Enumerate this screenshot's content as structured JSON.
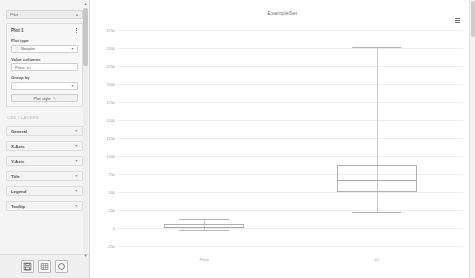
{
  "panel": {
    "header_title": "Plot",
    "header_icon": "collapse-icon",
    "plot_card": {
      "title": "Plot 1",
      "menu_icon": "kebab-menu-icon",
      "plot_type_label": "Plot type",
      "plot_type_value": "Boxplot",
      "plot_type_glyph": "boxplot-glyph",
      "value_columns_label": "Value columns",
      "value_columns_value": "Price, x#",
      "group_by_label": "Group by",
      "group_by_value": "-",
      "plot_style_label": "Plot style",
      "plot_style_glyph": "brush-icon"
    },
    "section_caption": "CSS / LAYERS",
    "accordions": [
      {
        "label": "General"
      },
      {
        "label": "X-Axis"
      },
      {
        "label": "Y-Axis"
      },
      {
        "label": "Title"
      },
      {
        "label": "Legend"
      },
      {
        "label": "Tooltip"
      }
    ],
    "toolbar": [
      {
        "name": "save-button",
        "icon": "floppy-disk-icon"
      },
      {
        "name": "table-button",
        "icon": "table-grid-icon"
      },
      {
        "name": "reset-button",
        "icon": "circle-reset-icon"
      }
    ]
  },
  "chart": {
    "title": "ExampleSet",
    "menu_icon": "hamburger-menu-icon"
  },
  "chart_data": {
    "type": "box",
    "title": "ExampleSet",
    "xlabel": "",
    "ylabel": "",
    "ylim": [
      -25000,
      275000
    ],
    "grid": true,
    "legend": false,
    "ytick_labels": [
      "275k",
      "250k",
      "225k",
      "200k",
      "175k",
      "150k",
      "125k",
      "100k",
      "75k",
      "50k",
      "25k",
      "0",
      "-25k"
    ],
    "ytick_values": [
      275000,
      250000,
      225000,
      200000,
      175000,
      150000,
      125000,
      100000,
      75000,
      50000,
      25000,
      0,
      -25000
    ],
    "categories": [
      "Price",
      "x#"
    ],
    "boxes": [
      {
        "name": "Price",
        "whisker_low": -3000,
        "q1": 0,
        "median": 2000,
        "q3": 6000,
        "whisker_high": 13000
      },
      {
        "name": "x#",
        "whisker_low": 22000,
        "q1": 50000,
        "median": 66000,
        "q3": 88000,
        "whisker_high": 252000
      }
    ]
  }
}
